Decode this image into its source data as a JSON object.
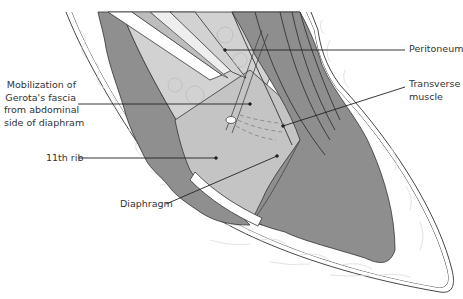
{
  "diagram": {
    "type": "anatomical-illustration",
    "style": "grayscale surgical line drawing",
    "colors": {
      "background": "#ffffff",
      "outline": "#333333",
      "fat_fill": "#ffffff",
      "fat_texture": "#dddddd",
      "dark_muscle": "#8f8f8f",
      "mid_tissue": "#b9b9b9",
      "light_tissue": "#d2d2d2",
      "rib": "#ffffff",
      "dashed_line": "#888888"
    },
    "labels": {
      "peritoneum": "Peritoneum",
      "transverse_muscle": "Transverse\nmuscle",
      "mobilization": "Mobilization of\nGerota's fascia\nfrom abdominal\nside of diaphram",
      "rib_11": "11th rib",
      "diaphragm": "Diaphragm"
    }
  }
}
